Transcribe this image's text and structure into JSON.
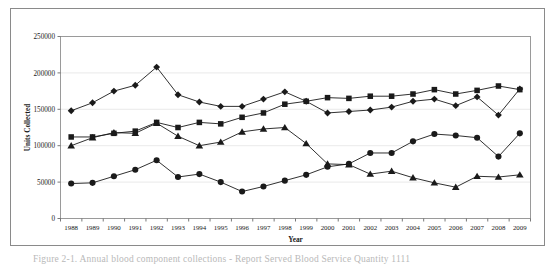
{
  "figure": {
    "caption": "Figure  2-1.  Annual blood component collections - Report Served Blood Service Quantity 1111"
  },
  "chart_data": {
    "type": "line",
    "title": "",
    "xlabel": "Year",
    "ylabel": "Units Collected",
    "grid": true,
    "legend": "none",
    "xlim": [
      1988,
      2009
    ],
    "ylim": [
      0,
      250000
    ],
    "ytick_values": [
      0,
      50000,
      100000,
      150000,
      200000,
      250000
    ],
    "ytick_labels": [
      "0",
      "50000",
      "100000",
      "150000",
      "200000",
      "250000"
    ],
    "categories": [
      1988,
      1989,
      1990,
      1991,
      1992,
      1993,
      1994,
      1995,
      1996,
      1997,
      1998,
      1999,
      2000,
      2001,
      2002,
      2003,
      2004,
      2005,
      2006,
      2007,
      2008,
      2009
    ],
    "xtick_labels": [
      "1988",
      "1989",
      "1990",
      "1991",
      "1992",
      "1993",
      "1994",
      "1995",
      "1996",
      "1997",
      "1998",
      "1999",
      "2000",
      "2001",
      "2002",
      "2003",
      "2004",
      "2005",
      "2006",
      "2007",
      "2008",
      "2009"
    ],
    "series": [
      {
        "name": "Series 1",
        "marker": "diamond",
        "color": "#1a1a1a",
        "values": [
          148000,
          159000,
          175000,
          183000,
          208000,
          170000,
          160000,
          154000,
          154000,
          164000,
          174000,
          161000,
          145000,
          147000,
          149000,
          153000,
          161000,
          164000,
          155000,
          167000,
          142000,
          178000
        ]
      },
      {
        "name": "Series 2",
        "marker": "square",
        "color": "#1a1a1a",
        "values": [
          112000,
          112000,
          117000,
          120000,
          132000,
          125000,
          132000,
          130000,
          139000,
          145000,
          157000,
          161000,
          166000,
          165000,
          168000,
          168000,
          171000,
          177000,
          171000,
          176000,
          182000,
          177000
        ]
      },
      {
        "name": "Series 3",
        "marker": "triangle",
        "color": "#1a1a1a",
        "values": [
          100000,
          111000,
          118000,
          117000,
          131000,
          113000,
          100000,
          105000,
          119000,
          123000,
          125000,
          103000,
          75000,
          74000,
          61000,
          65000,
          56000,
          49000,
          43000,
          58000,
          57000,
          60000
        ]
      },
      {
        "name": "Series 4",
        "marker": "circle",
        "color": "#1a1a1a",
        "values": [
          48000,
          49000,
          58000,
          67000,
          80000,
          57000,
          61000,
          50000,
          37000,
          44000,
          52000,
          60000,
          71000,
          75000,
          90000,
          90000,
          106000,
          116000,
          114000,
          111000,
          85000,
          117000
        ]
      }
    ]
  }
}
